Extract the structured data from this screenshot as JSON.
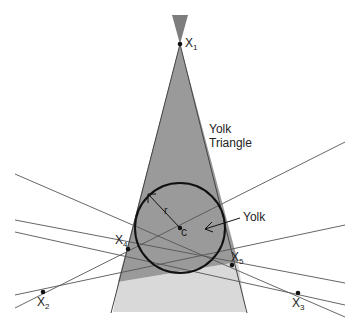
{
  "diagram": {
    "labels": {
      "yolk_triangle_line1": "Yolk",
      "yolk_triangle_line2": "Triangle",
      "yolk": "Yolk",
      "radius": "r",
      "center": "c"
    },
    "points": [
      {
        "id": "X1",
        "base": "X",
        "sub": "1",
        "x": 180,
        "y": 44
      },
      {
        "id": "X2",
        "base": "X",
        "sub": "2",
        "x": 43,
        "y": 292
      },
      {
        "id": "X3",
        "base": "X",
        "sub": "3",
        "x": 298,
        "y": 293
      },
      {
        "id": "X4",
        "base": "X",
        "sub": "4",
        "x": 128,
        "y": 249
      },
      {
        "id": "X5",
        "base": "X",
        "sub": "5",
        "x": 232,
        "y": 265
      }
    ],
    "colors": {
      "wedge_dark": "#8f8f8f",
      "wedge_light": "#d6d6d6",
      "lines": "#555555",
      "circle": "#111111"
    }
  }
}
